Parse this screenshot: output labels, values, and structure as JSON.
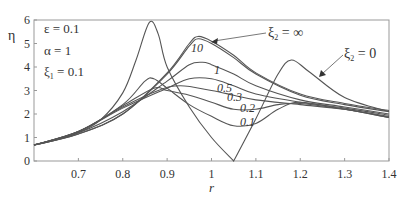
{
  "chart_data": {
    "type": "line",
    "title": "",
    "xlabel": "r",
    "ylabel": "η",
    "xlim": [
      0.6,
      1.4
    ],
    "ylim": [
      0,
      6
    ],
    "x_ticks": [
      "0.7",
      "0.8",
      "0.9",
      "1",
      "1.1",
      "1.2",
      "1.3",
      "1.4"
    ],
    "y_ticks": [
      "0",
      "1",
      "2",
      "3",
      "4",
      "5",
      "6"
    ],
    "grid": false,
    "parameters": [
      "ε = 0.1",
      "α = 1",
      "ξ₁ = 0.1"
    ],
    "series": [
      {
        "name": "ξ₂ = 0",
        "label": "ξ₂ = 0",
        "points": [
          [
            0.6,
            0.68
          ],
          [
            0.65,
            0.9
          ],
          [
            0.7,
            1.2
          ],
          [
            0.75,
            1.75
          ],
          [
            0.8,
            2.9
          ],
          [
            0.83,
            4.3
          ],
          [
            0.86,
            5.9
          ],
          [
            0.88,
            5.4
          ],
          [
            0.9,
            4.0
          ],
          [
            0.95,
            2.3
          ],
          [
            1.0,
            1.0
          ],
          [
            1.05,
            0.0
          ],
          [
            1.1,
            1.8
          ],
          [
            1.15,
            3.7
          ],
          [
            1.18,
            4.3
          ],
          [
            1.22,
            3.8
          ],
          [
            1.3,
            2.7
          ],
          [
            1.4,
            2.1
          ]
        ]
      },
      {
        "name": "ξ₂ = 0.1",
        "label": "0.1",
        "points": [
          [
            0.6,
            0.68
          ],
          [
            0.7,
            1.25
          ],
          [
            0.8,
            2.4
          ],
          [
            0.85,
            3.4
          ],
          [
            0.87,
            3.5
          ],
          [
            0.9,
            3.1
          ],
          [
            0.95,
            2.4
          ],
          [
            1.0,
            1.9
          ],
          [
            1.05,
            1.5
          ],
          [
            1.1,
            1.6
          ],
          [
            1.15,
            2.2
          ],
          [
            1.2,
            2.5
          ],
          [
            1.3,
            2.2
          ],
          [
            1.4,
            1.85
          ]
        ]
      },
      {
        "name": "ξ₂ = 0.2",
        "label": "0.2",
        "points": [
          [
            0.6,
            0.68
          ],
          [
            0.7,
            1.25
          ],
          [
            0.8,
            2.35
          ],
          [
            0.87,
            3.1
          ],
          [
            0.9,
            3.0
          ],
          [
            0.95,
            2.8
          ],
          [
            1.0,
            2.5
          ],
          [
            1.05,
            2.2
          ],
          [
            1.1,
            2.2
          ],
          [
            1.15,
            2.4
          ],
          [
            1.2,
            2.45
          ],
          [
            1.3,
            2.2
          ],
          [
            1.4,
            1.85
          ]
        ]
      },
      {
        "name": "ξ₂ = 0.3",
        "label": "0.3",
        "points": [
          [
            0.6,
            0.68
          ],
          [
            0.7,
            1.25
          ],
          [
            0.8,
            2.3
          ],
          [
            0.88,
            3.0
          ],
          [
            0.93,
            3.2
          ],
          [
            1.0,
            3.0
          ],
          [
            1.05,
            2.8
          ],
          [
            1.1,
            2.6
          ],
          [
            1.2,
            2.4
          ],
          [
            1.3,
            2.2
          ],
          [
            1.4,
            1.9
          ]
        ]
      },
      {
        "name": "ξ₂ = 0.5",
        "label": "0.5",
        "points": [
          [
            0.6,
            0.68
          ],
          [
            0.7,
            1.25
          ],
          [
            0.8,
            2.25
          ],
          [
            0.9,
            3.1
          ],
          [
            0.95,
            3.5
          ],
          [
            1.0,
            3.5
          ],
          [
            1.05,
            3.2
          ],
          [
            1.1,
            2.85
          ],
          [
            1.2,
            2.5
          ],
          [
            1.3,
            2.25
          ],
          [
            1.4,
            1.95
          ]
        ]
      },
      {
        "name": "ξ₂ = 1",
        "label": "1",
        "points": [
          [
            0.6,
            0.68
          ],
          [
            0.7,
            1.2
          ],
          [
            0.8,
            2.1
          ],
          [
            0.9,
            3.4
          ],
          [
            0.95,
            4.1
          ],
          [
            0.98,
            4.2
          ],
          [
            1.0,
            4.1
          ],
          [
            1.05,
            3.7
          ],
          [
            1.1,
            3.2
          ],
          [
            1.2,
            2.6
          ],
          [
            1.3,
            2.3
          ],
          [
            1.4,
            2.0
          ]
        ]
      },
      {
        "name": "ξ₂ = 10",
        "label": "10",
        "points": [
          [
            0.6,
            0.68
          ],
          [
            0.7,
            1.15
          ],
          [
            0.8,
            2.0
          ],
          [
            0.9,
            3.7
          ],
          [
            0.95,
            4.9
          ],
          [
            0.97,
            5.2
          ],
          [
            1.0,
            5.0
          ],
          [
            1.05,
            4.4
          ],
          [
            1.1,
            3.7
          ],
          [
            1.2,
            2.8
          ],
          [
            1.3,
            2.4
          ],
          [
            1.4,
            2.1
          ]
        ]
      },
      {
        "name": "ξ₂ = ∞",
        "label": "ξ₂ = ∞",
        "points": [
          [
            0.6,
            0.68
          ],
          [
            0.7,
            1.15
          ],
          [
            0.8,
            2.0
          ],
          [
            0.9,
            3.75
          ],
          [
            0.95,
            5.0
          ],
          [
            0.97,
            5.3
          ],
          [
            1.0,
            5.1
          ],
          [
            1.05,
            4.5
          ],
          [
            1.1,
            3.75
          ],
          [
            1.2,
            2.85
          ],
          [
            1.3,
            2.45
          ],
          [
            1.4,
            2.15
          ]
        ]
      }
    ],
    "annotations": [
      {
        "text": "ξ₂ = ∞",
        "arrow_to": [
          1.0,
          5.05
        ]
      },
      {
        "text": "ξ₂ = 0",
        "arrow_to": [
          1.21,
          3.9
        ]
      }
    ]
  },
  "labels": {
    "xlabel": "r",
    "ylabel": "η",
    "param1": "ε = 0.1",
    "param2": "α = 1",
    "param3_main": "ξ",
    "param3_sub": "1",
    "param3_rest": " = 0.1",
    "ann_inf_main": "ξ",
    "ann_inf_sub": "2",
    "ann_inf_rest": " = ∞",
    "ann_zero_main": "ξ",
    "ann_zero_sub": "2",
    "ann_zero_rest": " = 0",
    "curve_10": "10",
    "curve_1": "1",
    "curve_05": "0.5",
    "curve_03": "0.3",
    "curve_02": "0.2",
    "curve_01": "0.1"
  },
  "ticks": {
    "x": [
      "0.7",
      "0.8",
      "0.9",
      "1",
      "1.1",
      "1.2",
      "1.3",
      "1.4"
    ],
    "y": [
      "0",
      "1",
      "2",
      "3",
      "4",
      "5",
      "6"
    ]
  },
  "colors": {
    "line": "#555555",
    "axis": "#888888",
    "text": "#333333"
  }
}
